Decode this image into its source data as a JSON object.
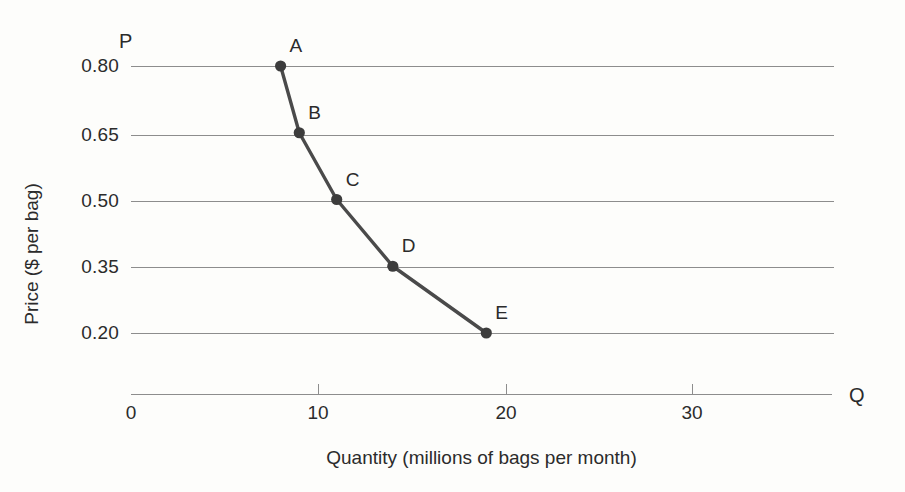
{
  "chart_data": {
    "type": "line",
    "title": "",
    "xlabel": "Quantity (millions of bags per month)",
    "ylabel": "Price ($ per bag)",
    "x_axis_letter": "Q",
    "y_axis_letter": "P",
    "xlim": [
      0,
      37.6
    ],
    "ylim": [
      0.125,
      0.875
    ],
    "grid": "horizontal",
    "legend": "none",
    "x_ticks": [
      {
        "value": 0,
        "label": "0"
      },
      {
        "value": 10,
        "label": "10"
      },
      {
        "value": 20,
        "label": "20"
      },
      {
        "value": 30,
        "label": "30"
      }
    ],
    "y_ticks": [
      {
        "value": 0.8,
        "label": "0.80"
      },
      {
        "value": 0.65,
        "label": "0.65"
      },
      {
        "value": 0.5,
        "label": "0.50"
      },
      {
        "value": 0.35,
        "label": "0.35"
      },
      {
        "value": 0.2,
        "label": "0.20"
      }
    ],
    "series": [
      {
        "name": "Demand curve",
        "color": "#4a4a4a",
        "marker": "filled-circle",
        "points": [
          {
            "label": "A",
            "x": 8,
            "y": 0.8
          },
          {
            "label": "B",
            "x": 9,
            "y": 0.65
          },
          {
            "label": "C",
            "x": 11,
            "y": 0.5
          },
          {
            "label": "D",
            "x": 14,
            "y": 0.35
          },
          {
            "label": "E",
            "x": 19,
            "y": 0.2
          }
        ]
      }
    ],
    "colors": {
      "background": "#fdfdfb",
      "gridline": "#8d8d8d",
      "axis": "#8d8d8d",
      "curve": "#4a4a4a",
      "marker": "#3c3c3c",
      "text": "#2b2b2b"
    }
  }
}
